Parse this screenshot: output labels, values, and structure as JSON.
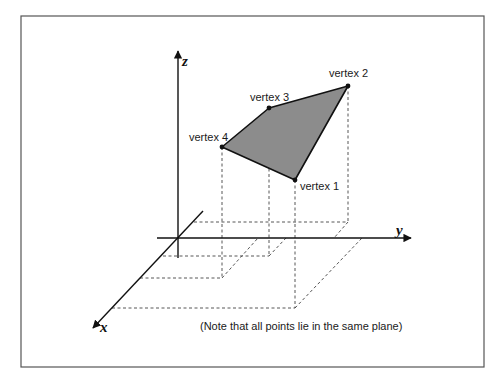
{
  "diagram": {
    "title": "",
    "axes": {
      "x_label": "x",
      "y_label": "y",
      "z_label": "z"
    },
    "vertices": [
      {
        "label": "vertex 1",
        "px": [
          295,
          180
        ]
      },
      {
        "label": "vertex 2",
        "px": [
          348,
          86
        ]
      },
      {
        "label": "vertex 3",
        "px": [
          269,
          108
        ]
      },
      {
        "label": "vertex 4",
        "px": [
          222,
          147
        ]
      }
    ],
    "note": "(Note that all points lie in the same plane)",
    "colors": {
      "polygon_fill": "#8c8c8c",
      "line": "#111111",
      "frame": "#555555",
      "dashed": "#444444"
    }
  }
}
